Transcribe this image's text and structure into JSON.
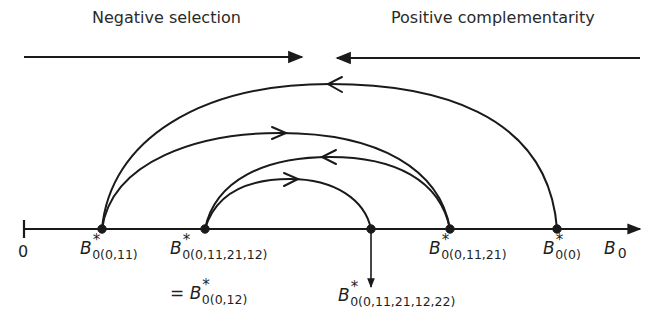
{
  "headers": {
    "left": "Negative selection",
    "right": "Positive complementarity"
  },
  "axis": {
    "origin_label": "0",
    "end_label": "B",
    "end_label_sub": "0"
  },
  "points": [
    {
      "id": "p1",
      "symbol": "B",
      "sup": "*",
      "sub": "0(0,11)"
    },
    {
      "id": "p2",
      "symbol": "B",
      "sup": "*",
      "sub": "0(0,11,21,12)",
      "equiv": "= B",
      "equiv_sup": "*",
      "equiv_sub": "0(0,12)"
    },
    {
      "id": "p3",
      "symbol": "B",
      "sup": "*",
      "sub": "0(0,11,21,12,22)"
    },
    {
      "id": "p4",
      "symbol": "B",
      "sup": "*",
      "sub": "0(0,11,21)"
    },
    {
      "id": "p5",
      "symbol": "B",
      "sup": "*",
      "sub": "0(0)"
    }
  ],
  "arcs": [
    {
      "from": "B*0(0)",
      "to": "B*0(0,11)",
      "direction": "left"
    },
    {
      "from": "B*0(0,11)",
      "to": "B*0(0,11,21)",
      "direction": "right"
    },
    {
      "from": "B*0(0,11,21)",
      "to": "B*0(0,11,21,12)",
      "direction": "left"
    },
    {
      "from": "B*0(0,11,21,12)",
      "to": "B*0(0,11,21,12,22)",
      "direction": "right"
    }
  ],
  "colors": {
    "ink": "#1a1a1a",
    "background": "#ffffff"
  }
}
